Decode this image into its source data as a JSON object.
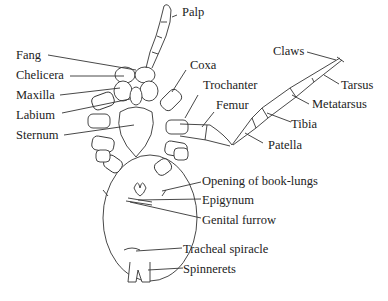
{
  "diagram": {
    "labels": {
      "palp": "Palp",
      "fang": "Fang",
      "chelicera": "Chelicera",
      "maxilla": "Maxilla",
      "labium": "Labium",
      "sternum": "Sternum",
      "coxa": "Coxa",
      "trochanter": "Trochanter",
      "femur": "Femur",
      "patella": "Patella",
      "tibia": "Tibia",
      "metatarsus": "Metatarsus",
      "tarsus": "Tarsus",
      "claws": "Claws",
      "book_lungs": "Opening of book-lungs",
      "epigynum": "Epigynum",
      "genital_furrow": "Genital furrow",
      "tracheal_spiracle": "Tracheal spiracle",
      "spinnerets": "Spinnerets"
    }
  }
}
